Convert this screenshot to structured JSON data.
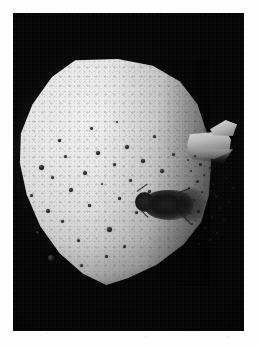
{
  "page": {
    "background_color": "#fdfdfd",
    "type": "scanned-photographic-plate",
    "caption": ""
  },
  "plate": {
    "label": "photographic plate",
    "background_color": "#050505",
    "left": 13,
    "top": 13,
    "width": 231,
    "height": 318
  },
  "specimen": {
    "label": "granular rounded specimen",
    "description": "bright porous rounded-polygonal body with granular surface texture",
    "highlight_color": "#f0f0f0",
    "midtone_color": "#cbcbcb",
    "shadow_color": "#3a3a3a"
  },
  "features": {
    "pores_label": "dark pores and surface specks",
    "blemish_label": "dark insect-like blemish",
    "fragment_label": "bright angular fragment at right edge",
    "debris_label": "scattered dark debris trail",
    "blemish_color": "#171717",
    "fragment_color": "#bcbcbc"
  },
  "pores": [
    {
      "x": 22,
      "y": 106,
      "d": 5.0
    },
    {
      "x": 34,
      "y": 117,
      "d": 3.0
    },
    {
      "x": 13,
      "y": 135,
      "d": 3.4
    },
    {
      "x": 29,
      "y": 150,
      "d": 4.2
    },
    {
      "x": 19,
      "y": 172,
      "d": 2.6
    },
    {
      "x": 31,
      "y": 196,
      "d": 6.2
    },
    {
      "x": 47,
      "y": 96,
      "d": 3.2
    },
    {
      "x": 52,
      "y": 129,
      "d": 3.8
    },
    {
      "x": 44,
      "y": 161,
      "d": 2.8
    },
    {
      "x": 60,
      "y": 180,
      "d": 3.0
    },
    {
      "x": 66,
      "y": 112,
      "d": 4.4
    },
    {
      "x": 71,
      "y": 145,
      "d": 2.6
    },
    {
      "x": 79,
      "y": 92,
      "d": 3.6
    },
    {
      "x": 84,
      "y": 124,
      "d": 2.4
    },
    {
      "x": 90,
      "y": 168,
      "d": 4.6
    },
    {
      "x": 96,
      "y": 104,
      "d": 3.0
    },
    {
      "x": 101,
      "y": 138,
      "d": 2.6
    },
    {
      "x": 108,
      "y": 86,
      "d": 4.0
    },
    {
      "x": 112,
      "y": 120,
      "d": 2.8
    },
    {
      "x": 118,
      "y": 152,
      "d": 3.2
    },
    {
      "x": 124,
      "y": 100,
      "d": 3.6
    },
    {
      "x": 131,
      "y": 131,
      "d": 2.6
    },
    {
      "x": 136,
      "y": 76,
      "d": 3.0
    },
    {
      "x": 143,
      "y": 110,
      "d": 4.2
    },
    {
      "x": 149,
      "y": 143,
      "d": 2.4
    },
    {
      "x": 155,
      "y": 94,
      "d": 3.4
    },
    {
      "x": 63,
      "y": 205,
      "d": 3.2
    },
    {
      "x": 88,
      "y": 196,
      "d": 2.8
    },
    {
      "x": 106,
      "y": 186,
      "d": 3.0
    },
    {
      "x": 41,
      "y": 80,
      "d": 2.6
    },
    {
      "x": 73,
      "y": 68,
      "d": 2.8
    },
    {
      "x": 99,
      "y": 62,
      "d": 2.4
    }
  ],
  "legs": [
    {
      "x": 4,
      "y": 12,
      "w": 13,
      "h": 1.4,
      "rot": -36
    },
    {
      "x": 6,
      "y": 16,
      "w": 11,
      "h": 1.3,
      "rot": -14
    },
    {
      "x": 5,
      "y": 24,
      "w": 12,
      "h": 1.3,
      "rot": 22
    },
    {
      "x": 8,
      "y": 31,
      "w": 10,
      "h": 1.2,
      "rot": 44
    },
    {
      "x": 44,
      "y": 14,
      "w": 14,
      "h": 1.4,
      "rot": -22
    },
    {
      "x": 46,
      "y": 28,
      "w": 15,
      "h": 1.3,
      "rot": 26
    },
    {
      "x": 50,
      "y": 36,
      "w": 12,
      "h": 1.2,
      "rot": 48
    }
  ],
  "debris_specks": [
    {
      "x": 2,
      "y": 6,
      "d": 2.2
    },
    {
      "x": 9,
      "y": 2,
      "d": 1.6
    },
    {
      "x": 14,
      "y": 10,
      "d": 2.6
    },
    {
      "x": 5,
      "y": 17,
      "d": 1.8
    },
    {
      "x": 18,
      "y": 21,
      "d": 2.0
    },
    {
      "x": 11,
      "y": 27,
      "d": 3.0
    },
    {
      "x": 24,
      "y": 14,
      "d": 1.5
    },
    {
      "x": 27,
      "y": 30,
      "d": 2.2
    },
    {
      "x": 3,
      "y": 34,
      "d": 2.4
    },
    {
      "x": 16,
      "y": 38,
      "d": 1.7
    },
    {
      "x": 30,
      "y": 42,
      "d": 2.8
    },
    {
      "x": 8,
      "y": 46,
      "d": 2.0
    },
    {
      "x": 21,
      "y": 50,
      "d": 1.6
    },
    {
      "x": 34,
      "y": 54,
      "d": 2.3
    },
    {
      "x": 12,
      "y": 57,
      "d": 2.6
    },
    {
      "x": 26,
      "y": 63,
      "d": 1.8
    },
    {
      "x": 38,
      "y": 66,
      "d": 2.0
    },
    {
      "x": 6,
      "y": 70,
      "d": 1.5
    },
    {
      "x": 19,
      "y": 74,
      "d": 2.4
    },
    {
      "x": 31,
      "y": 79,
      "d": 1.9
    },
    {
      "x": 43,
      "y": 48,
      "d": 1.7
    },
    {
      "x": 40,
      "y": 24,
      "d": 2.1
    },
    {
      "x": 47,
      "y": 34,
      "d": 1.5
    },
    {
      "x": 36,
      "y": 8,
      "d": 1.8
    },
    {
      "x": 24,
      "y": 86,
      "d": 2.2
    },
    {
      "x": 13,
      "y": 90,
      "d": 1.6
    }
  ]
}
